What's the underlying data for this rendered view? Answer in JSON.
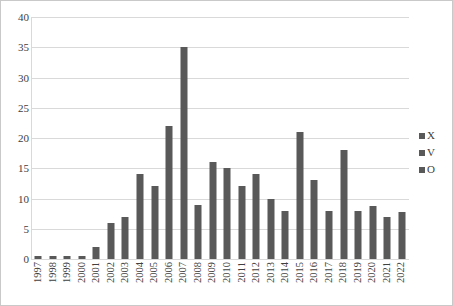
{
  "chart_data": {
    "type": "bar",
    "title": "",
    "subtitle": "",
    "xlabel": "",
    "ylabel": "",
    "ylim": [
      0,
      40
    ],
    "ytick_step": 5,
    "yticks": [
      "40",
      "35",
      "30",
      "25",
      "20",
      "15",
      "10",
      "5",
      "0"
    ],
    "grid": true,
    "legend_position": "right",
    "legend": [
      "X",
      "V",
      "O"
    ],
    "bar_color": "#595959",
    "gridline_color": "#d9d9d9",
    "border_color": "#c9c9c9",
    "text_color": "#404040",
    "categories": [
      "1997",
      "1998",
      "1999",
      "2000",
      "2001",
      "2002",
      "2003",
      "2004",
      "2005",
      "2006",
      "2007",
      "2008",
      "2009",
      "2010",
      "2011",
      "2012",
      "2013",
      "2014",
      "2015",
      "2016",
      "2017",
      "2018",
      "2019",
      "2020",
      "2021",
      "2022"
    ],
    "series": [
      {
        "name": "X",
        "values": [
          0.5,
          0.5,
          0.5,
          0.5,
          2,
          6,
          7,
          14,
          12,
          22,
          35,
          9,
          16,
          15,
          12,
          14,
          10,
          8,
          21,
          13,
          8,
          18,
          8,
          8.8,
          7,
          7.8
        ]
      }
    ],
    "values": [
      0.5,
      0.5,
      0.5,
      0.5,
      2,
      6,
      7,
      14,
      12,
      22,
      35,
      9,
      16,
      15,
      12,
      14,
      10,
      8,
      21,
      13,
      8,
      18,
      8,
      8.8,
      7,
      7.8
    ]
  }
}
